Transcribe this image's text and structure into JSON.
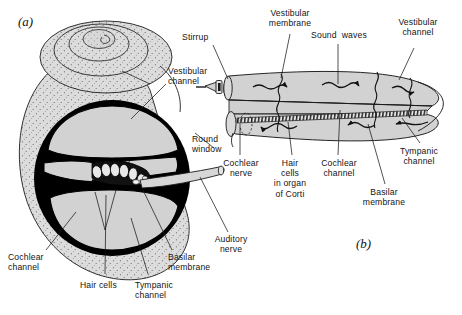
{
  "figure": {
    "panels": [
      {
        "id": "a",
        "caption": "(a)",
        "description": "Coiled cochlea with cutaway cross-section"
      },
      {
        "id": "b",
        "caption": "(b)",
        "description": "Uncoiled cochlea showing sound wave travel"
      }
    ],
    "colors": {
      "background": "#ffffff",
      "fill_gray": "#d2d2d2",
      "fill_gray_light": "#dcdcdc",
      "bone_black": "#000000",
      "outline": "#1a1a1a",
      "stipple": "#555555",
      "membrane_hatch": "#2b2b2b"
    }
  },
  "panel_a": {
    "caption": "(a)",
    "labels": [
      {
        "name": "vestibular-channel",
        "text": "Vestibular\nchannel",
        "x": 168,
        "y": 72,
        "align": "left"
      },
      {
        "name": "round-window",
        "text": "Round\nwindow",
        "x": 192,
        "y": 140,
        "align": "left"
      },
      {
        "name": "auditory-nerve",
        "text": "Auditory\nnerve",
        "x": 229,
        "y": 240,
        "align": "center"
      },
      {
        "name": "cochlear-channel",
        "text": "Cochlear\nchannel",
        "x": 10,
        "y": 258,
        "align": "left"
      },
      {
        "name": "hair-cells",
        "text": "Hair cells",
        "x": 83,
        "y": 283,
        "align": "left"
      },
      {
        "name": "tympanic-channel",
        "text": "Tympanic\nchannel",
        "x": 136,
        "y": 283,
        "align": "left"
      },
      {
        "name": "basilar-membrane",
        "text": "Basilar\nmembrane",
        "x": 170,
        "y": 258,
        "align": "left"
      }
    ]
  },
  "panel_b": {
    "caption": "(b)",
    "labels": [
      {
        "name": "stirrup",
        "text": "Stirrup",
        "x": 182,
        "y": 36,
        "align": "left"
      },
      {
        "name": "vestibular-membrane",
        "text": "Vestibular\nmembrane",
        "x": 275,
        "y": 12,
        "align": "center"
      },
      {
        "name": "sound-waves",
        "text": "Sound  waves",
        "x": 325,
        "y": 34,
        "align": "center"
      },
      {
        "name": "vestibular-channel",
        "text": "Vestibular\nchannel",
        "x": 404,
        "y": 27,
        "align": "center"
      },
      {
        "name": "cochlear-nerve",
        "text": "Cochlear\nnerve",
        "x": 239,
        "y": 164,
        "align": "center"
      },
      {
        "name": "hair-cells-organ-of-corti",
        "text": "Hair\ncells\nin organ\nof Corti",
        "x": 288,
        "y": 164,
        "align": "center"
      },
      {
        "name": "cochlear-channel",
        "text": "Cochlear\nchannel",
        "x": 334,
        "y": 164,
        "align": "center"
      },
      {
        "name": "basilar-membrane",
        "text": "Basilar\nmembrane",
        "x": 382,
        "y": 193,
        "align": "center"
      },
      {
        "name": "tympanic-channel",
        "text": "Tympanic\nchannel",
        "x": 415,
        "y": 152,
        "align": "center"
      }
    ]
  }
}
